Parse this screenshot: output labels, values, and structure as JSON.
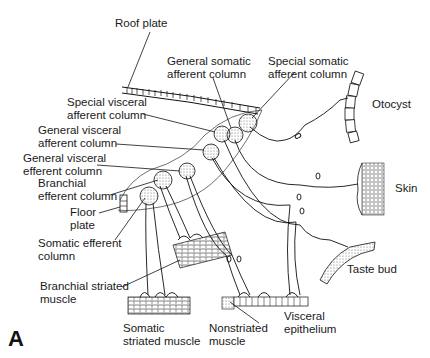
{
  "figure": {
    "panel_letter": "A"
  },
  "labels": {
    "roof_plate": "Roof plate",
    "gsa_1": "General somatic",
    "gsa_2": "afferent column",
    "ssa_1": "Special somatic",
    "ssa_2": "afferent column",
    "sva_1": "Special visceral",
    "sva_2": "afferent column",
    "gva_1": "General visceral",
    "gva_2": "afferent column",
    "gve_1": "General visceral",
    "gve_2": "efferent column",
    "be_1": "Branchial",
    "be_2": "efferent column",
    "floor_1": "Floor",
    "floor_2": "plate",
    "se_1": "Somatic efferent",
    "se_2": "column",
    "bsm_1": "Branchial striated",
    "bsm_2": "muscle",
    "ssm_1": "Somatic",
    "ssm_2": "striated muscle",
    "nsm_1": "Nonstriated",
    "nsm_2": "muscle",
    "ve_1": "Visceral",
    "ve_2": "epithelium",
    "otocyst": "Otocyst",
    "skin": "Skin",
    "taste_bud": "Taste bud"
  },
  "colors": {
    "line": "#111111",
    "stipple": "#777777",
    "background": "#ffffff"
  }
}
